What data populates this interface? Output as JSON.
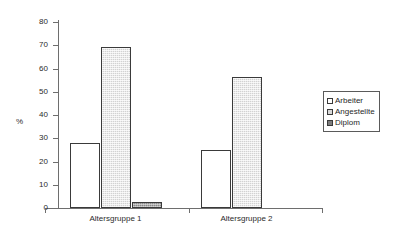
{
  "chart_data": {
    "type": "bar",
    "title": "",
    "subtitle": "",
    "xlabel": "",
    "ylabel": "%",
    "ylim": [
      0,
      80
    ],
    "ytick_values": [
      0,
      10,
      20,
      30,
      40,
      50,
      60,
      70,
      80
    ],
    "ytick_labels": [
      "0",
      "10",
      "20",
      "30",
      "40",
      "50",
      "60",
      "70",
      "80"
    ],
    "grid": false,
    "legend_position": "right",
    "categories": [
      "Altersgruppe 1",
      "Altersgruppe 2"
    ],
    "series": [
      {
        "name": "Arbeiter",
        "color": "#ffffff",
        "values": [
          27.8,
          25.0
        ]
      },
      {
        "name": "Angestellte",
        "color": "#d2d2d2",
        "values": [
          69.4,
          56.3
        ]
      },
      {
        "name": "Diplom",
        "color": "#8a8a8a",
        "values": [
          2.5,
          0
        ]
      }
    ]
  },
  "legend": {
    "items": [
      {
        "label": "Arbeiter"
      },
      {
        "label": "Angestellte"
      },
      {
        "label": "Diplom"
      }
    ]
  },
  "axes": {
    "y_title": "%"
  }
}
